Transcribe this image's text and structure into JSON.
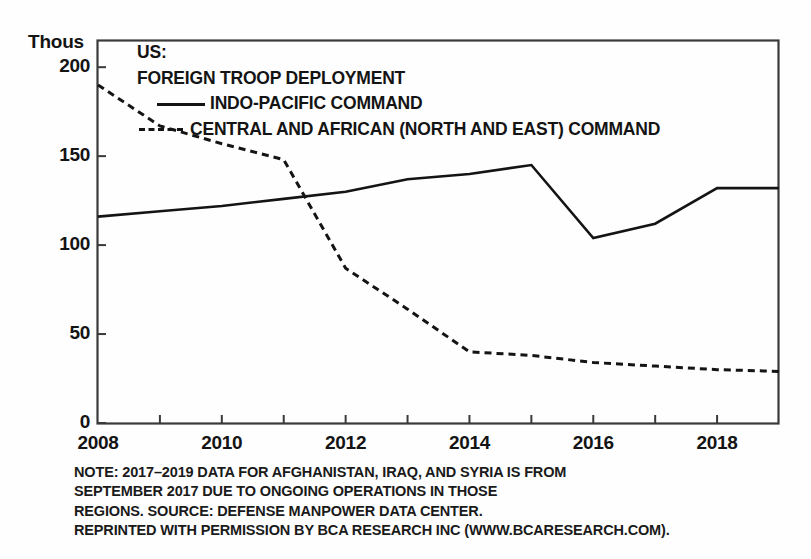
{
  "axis_unit_label": "Thous",
  "legend": {
    "title_line1": "US:",
    "title_line2": "FOREIGN TROOP DEPLOYMENT",
    "series1_label": "INDO-PACIFIC COMMAND",
    "series2_label": "CENTRAL AND AFRICAN (NORTH AND EAST) COMMAND",
    "series1_style": "solid",
    "series2_style": "dashed"
  },
  "notes": [
    "NOTE: 2017–2019 DATA FOR AFGHANISTAN, IRAQ, AND SYRIA IS FROM",
    "SEPTEMBER 2017 DUE TO ONGOING OPERATIONS IN THOSE",
    "REGIONS. SOURCE: DEFENSE MANPOWER DATA CENTER.",
    "REPRINTED WITH PERMISSION BY BCA RESEARCH INC (WWW.BCARESEARCH.COM)."
  ],
  "colors": {
    "ink": "#141414",
    "frame": "#3a3a3a",
    "background": "#fefefe"
  },
  "chart_data": {
    "type": "line",
    "title": "US: FOREIGN TROOP DEPLOYMENT",
    "xlabel": "",
    "ylabel": "Thous",
    "ylim": [
      0,
      215
    ],
    "xlim": [
      2008,
      2019
    ],
    "grid": false,
    "legend_position": "top-left-inside",
    "yticks": [
      0,
      50,
      100,
      150,
      200
    ],
    "ytick_labels": [
      "0",
      "50",
      "100",
      "150",
      "200"
    ],
    "x": [
      2008,
      2009,
      2010,
      2011,
      2012,
      2013,
      2014,
      2015,
      2016,
      2017,
      2018,
      2019
    ],
    "xticks": [
      2008,
      2009,
      2010,
      2011,
      2012,
      2013,
      2014,
      2015,
      2016,
      2017,
      2018,
      2019
    ],
    "xtick_labels_shown": [
      "2008",
      "2010",
      "2012",
      "2014",
      "2016",
      "2018"
    ],
    "xtick_labels_shown_values": [
      2008,
      2010,
      2012,
      2014,
      2016,
      2018
    ],
    "series": [
      {
        "name": "INDO-PACIFIC COMMAND",
        "style": "solid",
        "values": [
          116,
          119,
          122,
          126,
          130,
          137,
          140,
          145,
          104,
          112,
          132,
          132
        ]
      },
      {
        "name": "CENTRAL AND AFRICAN (NORTH AND EAST) COMMAND",
        "style": "dashed",
        "values": [
          190,
          167,
          157,
          148,
          87,
          64,
          40,
          38,
          34,
          32,
          30,
          29
        ]
      }
    ]
  }
}
